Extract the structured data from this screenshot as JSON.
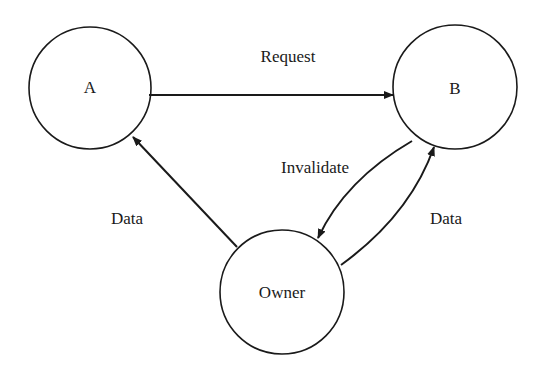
{
  "diagram": {
    "type": "state-transition",
    "colors": {
      "stroke": "#1a1a1a",
      "background": "#ffffff"
    },
    "nodes": [
      {
        "id": "A",
        "label": "A",
        "cx": 90,
        "cy": 88,
        "r": 61
      },
      {
        "id": "B",
        "label": "B",
        "cx": 455,
        "cy": 87,
        "r": 62
      },
      {
        "id": "Owner",
        "label": "Owner",
        "cx": 282,
        "cy": 292,
        "r": 62
      }
    ],
    "edges": [
      {
        "from": "A",
        "to": "B",
        "label": "Request"
      },
      {
        "from": "Owner",
        "to": "A",
        "label": "Data"
      },
      {
        "from": "B",
        "to": "Owner",
        "label": "Invalidate"
      },
      {
        "from": "Owner",
        "to": "B",
        "label": "Data"
      }
    ]
  }
}
